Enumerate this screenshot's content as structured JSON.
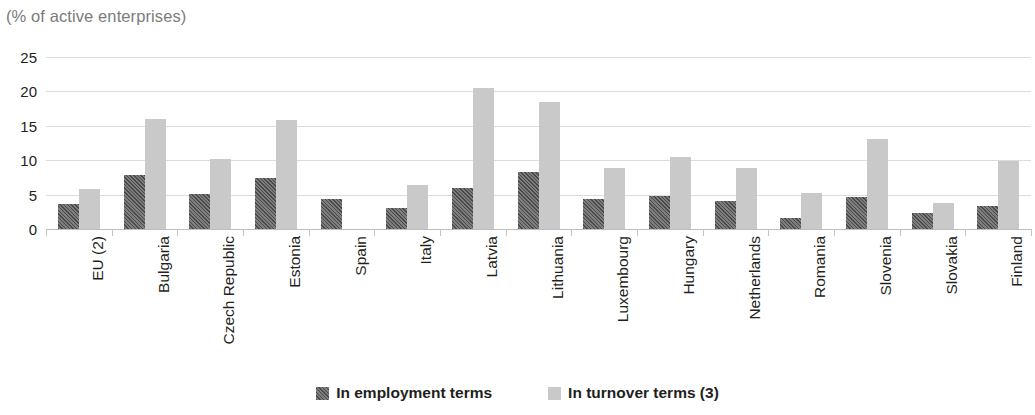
{
  "subtitle": "(% of active enterprises)",
  "legend": {
    "items": [
      {
        "label": "In employment terms",
        "swatch": "employment",
        "color": "#626262"
      },
      {
        "label": "In turnover terms (3)",
        "swatch": "turnover",
        "color": "#c9c9c9"
      }
    ]
  },
  "chart_data": {
    "type": "bar",
    "title": "",
    "subtitle": "(% of active enterprises)",
    "xlabel": "",
    "ylabel": "",
    "ylim": [
      0,
      25
    ],
    "yticks": [
      0,
      5,
      10,
      15,
      20,
      25
    ],
    "ytick_labels": [
      "0",
      "5",
      "10",
      "15",
      "20",
      "25"
    ],
    "grid": true,
    "legend_position": "bottom",
    "categories": [
      "EU (2)",
      "Bulgaria",
      "Czech Republic",
      "Estonia",
      "Spain",
      "Italy",
      "Latvia",
      "Lithuania",
      "Luxembourg",
      "Hungary",
      "Netherlands",
      "Romania",
      "Slovenia",
      "Slovakia",
      "Finland"
    ],
    "series": [
      {
        "name": "In employment terms",
        "color": "#626262",
        "values": [
          3.7,
          7.8,
          5.1,
          7.4,
          4.3,
          3.1,
          6.0,
          8.3,
          4.4,
          4.8,
          4.0,
          1.6,
          4.6,
          2.4,
          3.3
        ]
      },
      {
        "name": "In turnover terms (3)",
        "color": "#c9c9c9",
        "values": [
          5.8,
          16.0,
          10.2,
          15.9,
          null,
          6.4,
          20.5,
          18.5,
          8.9,
          10.5,
          8.9,
          5.3,
          13.1,
          3.8,
          9.9
        ]
      }
    ]
  }
}
